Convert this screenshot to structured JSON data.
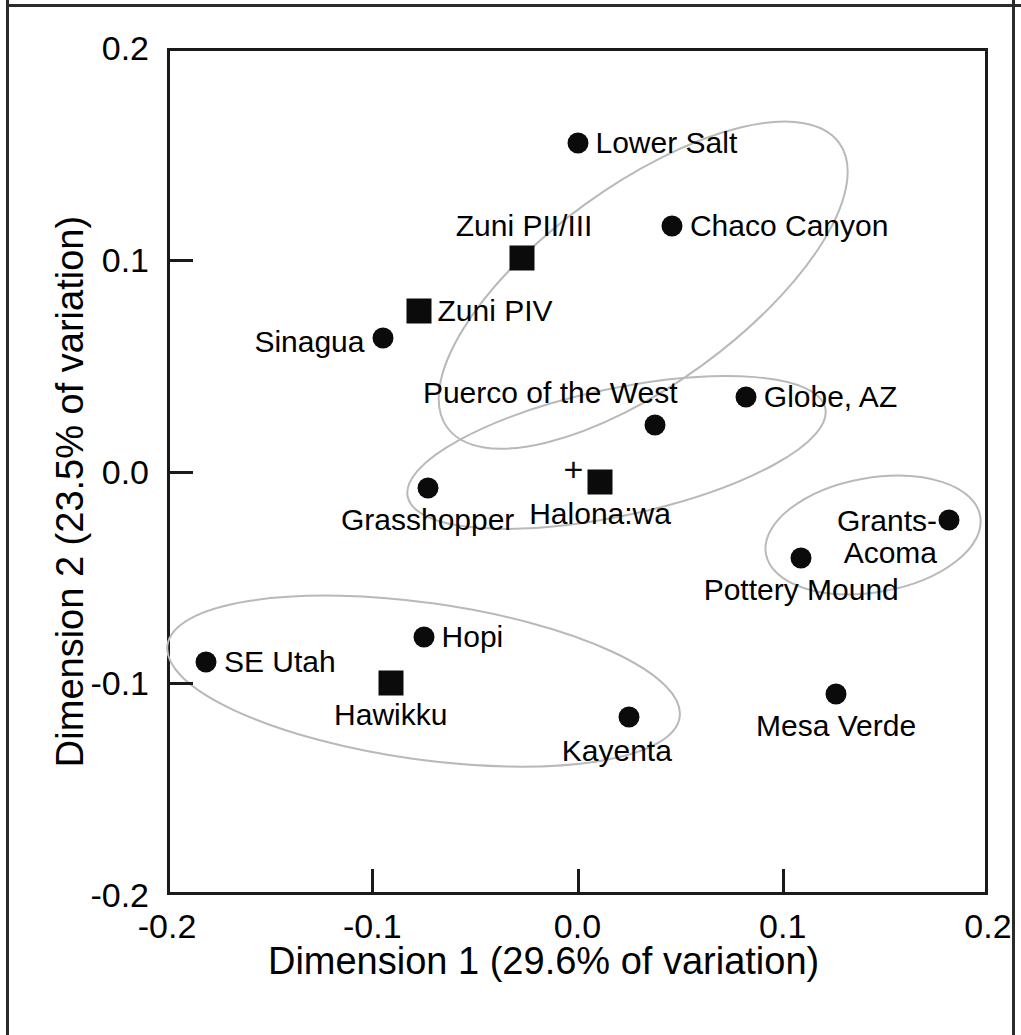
{
  "chart_data": {
    "type": "scatter",
    "title": "",
    "xlabel": "Dimension 1 (29.6% of variation)",
    "ylabel": "Dimension 2 (23.5% of variation)",
    "xlim": [
      -0.2,
      0.2
    ],
    "ylim": [
      -0.2,
      0.2
    ],
    "xticks": [
      "-0.2",
      "-0.1",
      "0.0",
      "0.1",
      "0.2"
    ],
    "yticks": [
      "0.2",
      "0.1",
      "0.0",
      "-0.1",
      "-0.2"
    ],
    "xtick_values": [
      -0.2,
      -0.1,
      0.0,
      0.1,
      0.2
    ],
    "ytick_values": [
      0.2,
      0.1,
      0.0,
      -0.1,
      -0.2
    ],
    "grid": false,
    "legend": "none",
    "points": [
      {
        "label": "Lower Salt",
        "x": 0.0,
        "y": 0.155,
        "marker": "circle",
        "label_pos": "right"
      },
      {
        "label": "Chaco Canyon",
        "x": 0.046,
        "y": 0.116,
        "marker": "circle",
        "label_pos": "right"
      },
      {
        "label": "Zuni PII/III",
        "x": -0.027,
        "y": 0.101,
        "marker": "square",
        "label_pos": "above"
      },
      {
        "label": "Zuni PIV",
        "x": -0.077,
        "y": 0.076,
        "marker": "square",
        "label_pos": "right"
      },
      {
        "label": "Sinagua",
        "x": -0.095,
        "y": 0.063,
        "marker": "circle",
        "label_pos": "left"
      },
      {
        "label": "Globe, AZ",
        "x": 0.082,
        "y": 0.035,
        "marker": "circle",
        "label_pos": "right"
      },
      {
        "label": "Puerco of the West",
        "x": 0.038,
        "y": 0.022,
        "marker": "circle",
        "label_pos": "above-left"
      },
      {
        "label": "Grasshopper",
        "x": -0.073,
        "y": -0.008,
        "marker": "circle",
        "label_pos": "below"
      },
      {
        "label": "Halona:wa",
        "x": 0.011,
        "y": -0.005,
        "marker": "square",
        "label_pos": "below"
      },
      {
        "label": "Halona:wa-cross",
        "x": -0.002,
        "y": 0.001,
        "marker": "cross",
        "label_pos": "none"
      },
      {
        "label": "Grants-Acoma",
        "x": 0.181,
        "y": -0.023,
        "marker": "circle",
        "label_pos": "left-two-line"
      },
      {
        "label": "Pottery Mound",
        "x": 0.109,
        "y": -0.041,
        "marker": "circle",
        "label_pos": "below"
      },
      {
        "label": "Hopi",
        "x": -0.075,
        "y": -0.078,
        "marker": "circle",
        "label_pos": "right"
      },
      {
        "label": "SE Utah",
        "x": -0.181,
        "y": -0.09,
        "marker": "circle",
        "label_pos": "right"
      },
      {
        "label": "Hawikku",
        "x": -0.091,
        "y": -0.1,
        "marker": "square",
        "label_pos": "below"
      },
      {
        "label": "Mesa Verde",
        "x": 0.126,
        "y": -0.105,
        "marker": "circle",
        "label_pos": "below"
      },
      {
        "label": "Kayenta",
        "x": 0.025,
        "y": -0.116,
        "marker": "circle",
        "label_pos": "below-left"
      }
    ],
    "ellipses": [
      {
        "name": "upper-cluster",
        "cx": 0.032,
        "cy": 0.088,
        "rx": 0.118,
        "ry": 0.047,
        "rotation_deg": -36
      },
      {
        "name": "middle-cluster",
        "cx": 0.019,
        "cy": 0.009,
        "rx": 0.104,
        "ry": 0.03,
        "rotation_deg": -12
      },
      {
        "name": "right-cluster",
        "cx": 0.144,
        "cy": -0.03,
        "rx": 0.053,
        "ry": 0.027,
        "rotation_deg": -10
      },
      {
        "name": "lower-cluster",
        "cx": -0.075,
        "cy": -0.099,
        "rx": 0.126,
        "ry": 0.037,
        "rotation_deg": 8
      }
    ],
    "marker_legend": {
      "circle": "comparison site",
      "square": "Zuni-area site",
      "cross": "centroid"
    }
  },
  "colors": {
    "axis": "#1a1a1a",
    "marker": "#0b0b0b",
    "ellipse": "#b9b9b9",
    "background": "#ffffff"
  }
}
